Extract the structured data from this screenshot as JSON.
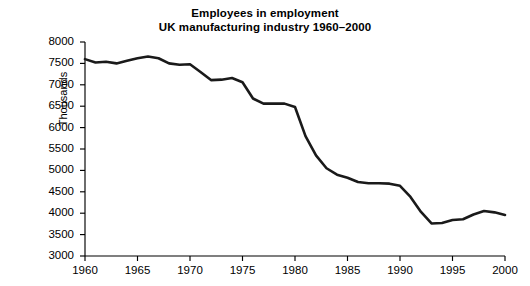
{
  "chart_data": {
    "type": "line",
    "title": "Employees in employment\nUK manufacturing industry 1960–2000",
    "title_line1": "Employees in employment",
    "title_line2": "UK manufacturing industry 1960–2000",
    "xlabel": "",
    "ylabel": "Thousands",
    "xlim": [
      1960,
      2000
    ],
    "ylim": [
      3000,
      8000
    ],
    "ytick_labels": [
      "8000",
      "7500",
      "7000",
      "6500",
      "6000",
      "5500",
      "5000",
      "4500",
      "4000",
      "3500",
      "3000"
    ],
    "yticks": [
      8000,
      7500,
      7000,
      6500,
      6000,
      5500,
      5000,
      4500,
      4000,
      3500,
      3000
    ],
    "xtick_labels": [
      "1960",
      "1965",
      "1970",
      "1975",
      "1980",
      "1985",
      "1990",
      "1995",
      "2000"
    ],
    "xticks": [
      1960,
      1965,
      1970,
      1975,
      1980,
      1985,
      1990,
      1995,
      2000
    ],
    "grid": false,
    "legend": false,
    "line_color": "#1a1a1a",
    "x": [
      1960,
      1961,
      1962,
      1963,
      1964,
      1965,
      1966,
      1967,
      1968,
      1969,
      1970,
      1971,
      1972,
      1973,
      1974,
      1975,
      1976,
      1977,
      1978,
      1979,
      1980,
      1981,
      1982,
      1983,
      1984,
      1985,
      1986,
      1987,
      1988,
      1989,
      1990,
      1991,
      1992,
      1993,
      1994,
      1995,
      1996,
      1997,
      1998,
      1999,
      2000
    ],
    "values": [
      7600,
      7520,
      7540,
      7500,
      7560,
      7620,
      7660,
      7620,
      7500,
      7470,
      7480,
      7300,
      7110,
      7120,
      7160,
      7060,
      6680,
      6560,
      6560,
      6560,
      6480,
      5800,
      5350,
      5050,
      4900,
      4830,
      4730,
      4700,
      4700,
      4690,
      4640,
      4380,
      4030,
      3760,
      3770,
      3840,
      3860,
      3970,
      4050,
      4020,
      3960
    ],
    "series": [
      {
        "name": "Employees in employment, UK manufacturing",
        "values": [
          7600,
          7520,
          7540,
          7500,
          7560,
          7620,
          7660,
          7620,
          7500,
          7470,
          7480,
          7300,
          7110,
          7120,
          7160,
          7060,
          6680,
          6560,
          6560,
          6560,
          6480,
          5800,
          5350,
          5050,
          4900,
          4830,
          4730,
          4700,
          4700,
          4690,
          4640,
          4380,
          4030,
          3760,
          3770,
          3840,
          3860,
          3970,
          4050,
          4020,
          3960
        ]
      }
    ]
  },
  "geometry": {
    "plot_left": 85,
    "plot_right": 505,
    "plot_top": 42,
    "plot_bottom": 256
  }
}
